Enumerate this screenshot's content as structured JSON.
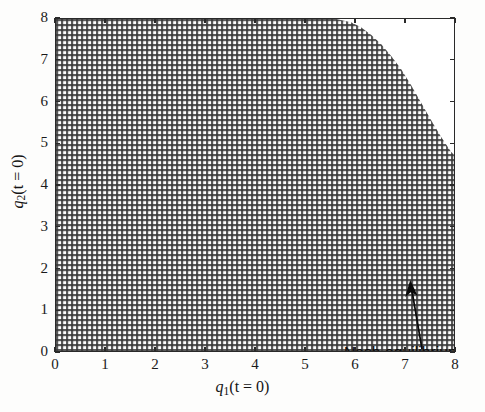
{
  "figure": {
    "background_color": "#fdfdfc",
    "plot_background_color": "#ffffff",
    "axis_color": "#2a2a2a",
    "fill_pattern_color": "#555555"
  },
  "annotations": {
    "nash": {
      "text": "Nash equilibrium",
      "arrow_from_x": 6.55,
      "arrow_from_y": 1.4,
      "arrow_to_x": 6.0,
      "arrow_to_y": 2.3
    }
  },
  "axis_titles": {
    "x_var": "q",
    "x_sub": "1",
    "x_rest": "(t = 0)",
    "y_var": "q",
    "y_sub": "2",
    "y_rest": "(t = 0)"
  },
  "chart_data": {
    "type": "area",
    "title": "",
    "xlabel": "q_1(t = 0)",
    "ylabel": "q_2(t = 0)",
    "xlim": [
      0,
      8
    ],
    "ylim": [
      0,
      8
    ],
    "xticks": [
      0,
      1,
      2,
      3,
      4,
      5,
      6,
      7,
      8
    ],
    "yticks": [
      0,
      1,
      2,
      3,
      4,
      5,
      6,
      7,
      8
    ],
    "xticklabels": [
      "0",
      "1",
      "2",
      "3",
      "4",
      "5",
      "6",
      "7",
      "8"
    ],
    "yticklabels": [
      "0",
      "1",
      "2",
      "3",
      "4",
      "5",
      "6",
      "7",
      "8"
    ],
    "grid": false,
    "legend": null,
    "series": [
      {
        "name": "convergence region",
        "fill": "crosshatch",
        "description": "Shaded set of initial conditions (q1(t=0), q2(t=0)) converging to the Nash equilibrium",
        "boundary_x": [
          0.0,
          5.6,
          5.9,
          6.1,
          6.3,
          6.5,
          6.7,
          6.9,
          7.1,
          7.3,
          7.5,
          7.7,
          7.9,
          8.0
        ],
        "boundary_y": [
          8.0,
          8.0,
          7.92,
          7.8,
          7.62,
          7.4,
          7.12,
          6.8,
          6.42,
          6.0,
          5.58,
          5.18,
          4.82,
          4.7
        ]
      }
    ],
    "annotations": [
      {
        "label": "Nash equilibrium",
        "point_x": 6.0,
        "point_y": 2.3,
        "text_x": 5.85,
        "text_y": 0.62
      }
    ]
  }
}
